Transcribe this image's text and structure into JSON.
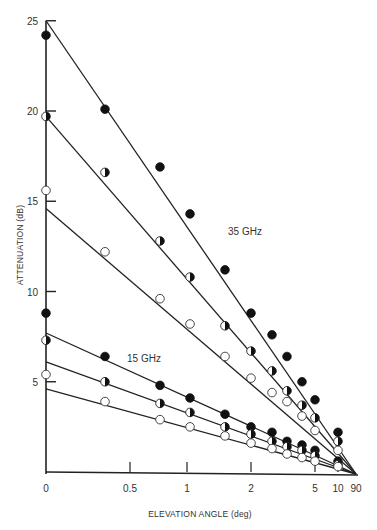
{
  "chart_data": {
    "type": "scatter",
    "title": "",
    "xlabel": "ELEVATION ANGLE (deg)",
    "ylabel": "ATTENUATION (dB)",
    "x_tick_labels": [
      "0",
      "0.5",
      "1",
      "2",
      "5",
      "10",
      "90"
    ],
    "x_ticks_scale": "cosecant (1/sin elevation), plotted as decreasing path length",
    "y_tick_labels": [
      "5",
      "10",
      "15",
      "20",
      "25"
    ],
    "ylim": [
      0,
      25
    ],
    "grid": false,
    "annotations": [
      "35 GHz",
      "15 GHz"
    ],
    "marker_legend": {
      "filled": "filled circle",
      "half": "half-filled circle",
      "open": "open circle"
    },
    "series": [
      {
        "name": "35 GHz filled",
        "frequency": "35 GHz",
        "marker": "filled",
        "points": [
          [
            0,
            24.2
          ],
          [
            0.35,
            20.1
          ],
          [
            0.75,
            16.9
          ],
          [
            1.05,
            14.3
          ],
          [
            1.55,
            11.2
          ],
          [
            2.0,
            8.8
          ],
          [
            2.6,
            7.6
          ],
          [
            3.2,
            6.4
          ],
          [
            4.0,
            5.0
          ],
          [
            5.0,
            4.0
          ],
          [
            10,
            2.2
          ]
        ],
        "line": {
          "y_at_0": 25.0,
          "y_at_90": 0
        }
      },
      {
        "name": "35 GHz half",
        "frequency": "35 GHz",
        "marker": "half",
        "points": [
          [
            0,
            19.7
          ],
          [
            0.35,
            16.6
          ],
          [
            0.75,
            12.8
          ],
          [
            1.05,
            10.8
          ],
          [
            1.55,
            8.1
          ],
          [
            2.0,
            6.7
          ],
          [
            2.6,
            5.6
          ],
          [
            3.2,
            4.5
          ],
          [
            4.0,
            3.7
          ],
          [
            5.0,
            3.0
          ],
          [
            10,
            1.7
          ]
        ],
        "line": {
          "y_at_0": 19.7,
          "y_at_90": 0
        }
      },
      {
        "name": "35 GHz open",
        "frequency": "35 GHz",
        "marker": "open",
        "points": [
          [
            0,
            15.6
          ],
          [
            0.35,
            12.2
          ],
          [
            0.75,
            9.6
          ],
          [
            1.05,
            8.2
          ],
          [
            1.55,
            6.4
          ],
          [
            2.0,
            5.2
          ],
          [
            2.6,
            4.4
          ],
          [
            3.2,
            3.9
          ],
          [
            4.0,
            3.1
          ],
          [
            5.0,
            2.3
          ],
          [
            10,
            1.2
          ]
        ],
        "line": {
          "y_at_0": 14.6,
          "y_at_90": 0
        }
      },
      {
        "name": "15 GHz filled",
        "frequency": "15 GHz",
        "marker": "filled",
        "points": [
          [
            0,
            8.8
          ],
          [
            0.35,
            6.4
          ],
          [
            0.75,
            4.8
          ],
          [
            1.05,
            4.1
          ],
          [
            1.55,
            3.2
          ],
          [
            2.0,
            2.5
          ],
          [
            2.6,
            2.2
          ],
          [
            3.2,
            1.7
          ],
          [
            4.0,
            1.5
          ],
          [
            5.0,
            1.2
          ],
          [
            10,
            0.6
          ]
        ],
        "line": {
          "y_at_0": 7.7,
          "y_at_90": 0
        }
      },
      {
        "name": "15 GHz half",
        "frequency": "15 GHz",
        "marker": "half",
        "points": [
          [
            0,
            7.3
          ],
          [
            0.35,
            5.0
          ],
          [
            0.75,
            3.8
          ],
          [
            1.05,
            3.3
          ],
          [
            1.55,
            2.5
          ],
          [
            2.0,
            2.1
          ],
          [
            2.6,
            1.7
          ],
          [
            3.2,
            1.4
          ],
          [
            4.0,
            1.2
          ],
          [
            5.0,
            0.9
          ],
          [
            10,
            0.4
          ]
        ],
        "line": {
          "y_at_0": 6.1,
          "y_at_90": 0
        }
      },
      {
        "name": "15 GHz open",
        "frequency": "15 GHz",
        "marker": "open",
        "points": [
          [
            0,
            5.4
          ],
          [
            0.35,
            3.9
          ],
          [
            0.75,
            2.9
          ],
          [
            1.05,
            2.5
          ],
          [
            1.55,
            2.0
          ],
          [
            2.0,
            1.6
          ],
          [
            2.6,
            1.3
          ],
          [
            3.2,
            1.0
          ],
          [
            4.0,
            0.8
          ],
          [
            5.0,
            0.6
          ],
          [
            10,
            0.3
          ]
        ],
        "line": {
          "y_at_0": 4.6,
          "y_at_90": 0
        }
      }
    ]
  },
  "axes": {
    "x_title": "ELEVATION ANGLE  (deg)",
    "y_title": "ATTENUATION (dB)",
    "annotations": {
      "ghz35": "35 GHz",
      "ghz15": "15 GHz"
    }
  }
}
